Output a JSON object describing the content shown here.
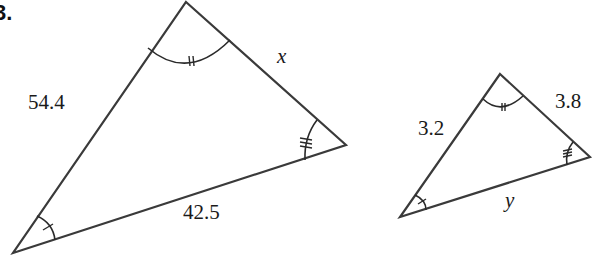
{
  "question": {
    "number": "3."
  },
  "big_triangle": {
    "vertices": {
      "apex": [
        186,
        2
      ],
      "right": [
        346,
        145
      ],
      "bottom_left": [
        13,
        253
      ]
    },
    "labels": {
      "left_side": "54.4",
      "right_side": "x",
      "bottom_side": "42.5"
    },
    "angle_marks": {
      "apex": "double-tick",
      "right": "triple-tick",
      "bottom_left": "single-tick"
    }
  },
  "small_triangle": {
    "vertices": {
      "apex": [
        500,
        74
      ],
      "right": [
        590,
        157
      ],
      "bottom_left": [
        400,
        217
      ]
    },
    "labels": {
      "left_side": "3.2",
      "right_side": "3.8",
      "bottom_side": "y"
    },
    "angle_marks": {
      "apex": "double-tick",
      "right": "triple-tick",
      "bottom_left": "single-tick"
    }
  },
  "colors": {
    "line": "#3a3a3a",
    "text": "#1a1a1a",
    "background": "#ffffff"
  }
}
